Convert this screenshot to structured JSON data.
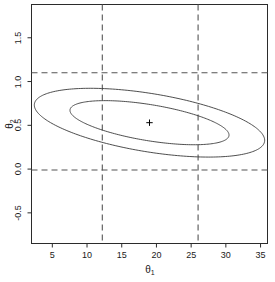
{
  "chart_data": {
    "type": "line",
    "title": "",
    "subtitle": "",
    "xlabel": "θ₁",
    "ylabel": "θ₂",
    "xlabel_base": "θ",
    "xlabel_sub": "1",
    "ylabel_base": "θ",
    "ylabel_sub": "2",
    "xlim": [
      2.0,
      36.0
    ],
    "ylim": [
      -0.85,
      1.88
    ],
    "xticks": [
      5,
      10,
      15,
      20,
      25,
      30,
      35
    ],
    "xtick_labels": [
      "5",
      "10",
      "15",
      "20",
      "25",
      "30",
      "35"
    ],
    "yticks": [
      -0.5,
      0.0,
      0.5,
      1.0,
      1.5
    ],
    "ytick_labels": [
      "-0.5",
      "0.0",
      "0.5",
      "1.0",
      "1.5"
    ],
    "grid": false,
    "legend": null,
    "frame": true,
    "point_estimate": {
      "label": "+",
      "x": 19.0,
      "y": 0.53
    },
    "reference_lines": {
      "vertical": [
        {
          "x": 12.2,
          "style": "dashed"
        },
        {
          "x": 26.0,
          "style": "dashed"
        }
      ],
      "horizontal": [
        {
          "y": 1.1,
          "style": "dashed"
        },
        {
          "y": -0.01,
          "style": "dashed"
        }
      ]
    },
    "series": [
      {
        "name": "outer-confidence-ellipse",
        "type": "ellipse",
        "center": [
          19.0,
          0.53
        ],
        "semi_major": 16.8,
        "semi_minor": 4.2,
        "rotation_deg": -9.3,
        "correlation": "negative",
        "x_extent": [
          4.0,
          34.0
        ],
        "y_extent": [
          -0.68,
          1.78
        ]
      },
      {
        "name": "inner-confidence-ellipse",
        "type": "ellipse",
        "center": [
          19.0,
          0.53
        ],
        "semi_major": 11.6,
        "semi_minor": 2.6,
        "rotation_deg": -9.3,
        "correlation": "negative",
        "x_extent": [
          9.8,
          28.2
        ],
        "y_extent": [
          -0.22,
          1.28
        ]
      }
    ],
    "colors": {
      "line": "#3a3a3a",
      "dashed": "#555555",
      "axis": "#2b2b2b",
      "background": "#ffffff",
      "marker": "#000000"
    }
  }
}
